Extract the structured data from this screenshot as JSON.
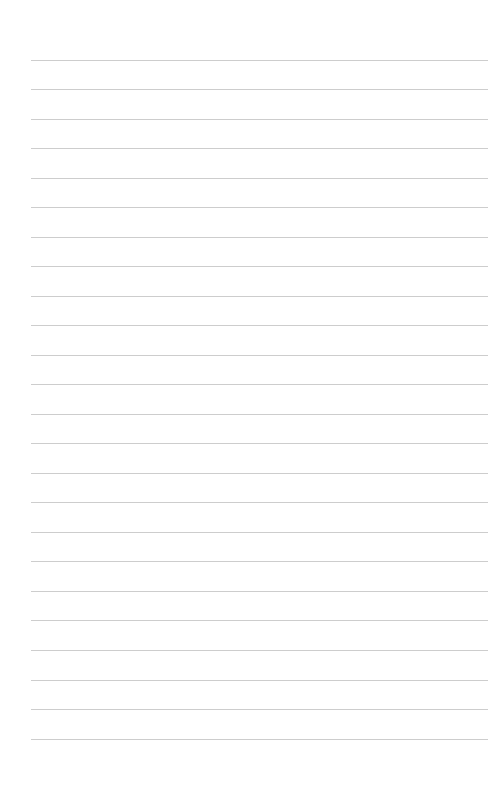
{
  "page": {
    "kind": "ruled-notebook-page",
    "width": 491,
    "height": 790,
    "background_color": "#ffffff",
    "content_text": "",
    "is_blank": true
  },
  "ruling": {
    "line_color": "#cdcdcd",
    "line_thickness_px": 1,
    "line_spacing_px": 29.5,
    "first_line_y_px": 60,
    "last_line_y_px": 739,
    "line_count": 24,
    "left_margin_px": 31,
    "right_margin_px": 3,
    "line_length_px": 457,
    "top_margin_px": 60,
    "bottom_margin_px": 51,
    "vertical_margin_rule": "none"
  },
  "lines": [
    {
      "index": 1,
      "y": 60,
      "text": ""
    },
    {
      "index": 2,
      "y": 89,
      "text": ""
    },
    {
      "index": 3,
      "y": 119,
      "text": ""
    },
    {
      "index": 4,
      "y": 148,
      "text": ""
    },
    {
      "index": 5,
      "y": 178,
      "text": ""
    },
    {
      "index": 6,
      "y": 207,
      "text": ""
    },
    {
      "index": 7,
      "y": 237,
      "text": ""
    },
    {
      "index": 8,
      "y": 266,
      "text": ""
    },
    {
      "index": 9,
      "y": 296,
      "text": ""
    },
    {
      "index": 10,
      "y": 325,
      "text": ""
    },
    {
      "index": 11,
      "y": 355,
      "text": ""
    },
    {
      "index": 12,
      "y": 384,
      "text": ""
    },
    {
      "index": 13,
      "y": 414,
      "text": ""
    },
    {
      "index": 14,
      "y": 443,
      "text": ""
    },
    {
      "index": 15,
      "y": 473,
      "text": ""
    },
    {
      "index": 16,
      "y": 502,
      "text": ""
    },
    {
      "index": 17,
      "y": 532,
      "text": ""
    },
    {
      "index": 18,
      "y": 561,
      "text": ""
    },
    {
      "index": 19,
      "y": 591,
      "text": ""
    },
    {
      "index": 20,
      "y": 620,
      "text": ""
    },
    {
      "index": 21,
      "y": 650,
      "text": ""
    },
    {
      "index": 22,
      "y": 680,
      "text": ""
    },
    {
      "index": 23,
      "y": 709,
      "text": ""
    },
    {
      "index": 24,
      "y": 739,
      "text": ""
    }
  ]
}
